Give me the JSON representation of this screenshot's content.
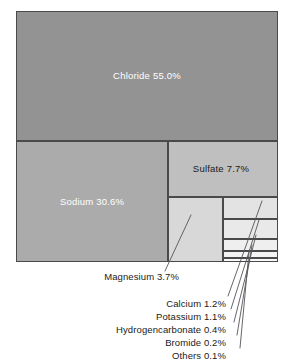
{
  "figure": {
    "background_color": "#ffffff",
    "border_color": "#4a4a4a"
  },
  "chart_data": {
    "type": "treemap",
    "title": "",
    "subtitle": "",
    "xlabel": "",
    "ylabel": "",
    "unit": "%",
    "legend": "none",
    "grid": false,
    "value_total": 100.0,
    "categories": [
      "Chloride",
      "Sodium",
      "Sulfate",
      "Magnesium",
      "Calcium",
      "Potassium",
      "Hydrogencarbonate",
      "Bromide",
      "Others"
    ],
    "values": [
      55.0,
      30.6,
      7.7,
      3.7,
      1.2,
      1.1,
      0.4,
      0.2,
      0.1
    ],
    "series": [
      {
        "name": "Share of dissolved salts",
        "values": [
          55.0,
          30.6,
          7.7,
          3.7,
          1.2,
          1.1,
          0.4,
          0.2,
          0.1
        ]
      }
    ],
    "blocks": [
      {
        "name": "chloride",
        "label": "Chloride 55.0%",
        "category": "Chloride",
        "value": 55.0,
        "value_text": "55.0%",
        "color": "#939393",
        "text_color": "#ffffff",
        "label_placement": "inside",
        "rect": {
          "x": 0,
          "y": 0,
          "w": 262,
          "h": 130
        }
      },
      {
        "name": "sodium",
        "label": "Sodium 30.6%",
        "category": "Sodium",
        "value": 30.6,
        "value_text": "30.6%",
        "color": "#ababab",
        "text_color": "#ffffff",
        "label_placement": "inside",
        "rect": {
          "x": 0,
          "y": 130,
          "w": 152,
          "h": 121
        }
      },
      {
        "name": "sulfate",
        "label": "Sulfate  7.7%",
        "category": "Sulfate",
        "value": 7.7,
        "value_text": "7.7%",
        "color": "#bfbfbf",
        "text_color": "#1a1a1a",
        "label_placement": "inside",
        "rect": {
          "x": 152,
          "y": 130,
          "w": 110,
          "h": 56
        }
      },
      {
        "name": "magnesium",
        "label": "Magnesium 3.7%",
        "category": "Magnesium",
        "value": 3.7,
        "value_text": "3.7%",
        "color": "#d8d8d8",
        "text_color": "#1a1a1a",
        "label_placement": "callout",
        "rect": {
          "x": 152,
          "y": 186,
          "w": 55,
          "h": 65
        }
      },
      {
        "name": "calcium",
        "label": "Calcium 1.2%",
        "category": "Calcium",
        "value": 1.2,
        "value_text": "1.2%",
        "color": "#e3e3e3",
        "text_color": "#1a1a1a",
        "label_placement": "callout",
        "rect": {
          "x": 207,
          "y": 186,
          "w": 55,
          "h": 22
        }
      },
      {
        "name": "potassium",
        "label": "Potassium 1.1%",
        "category": "Potassium",
        "value": 1.1,
        "value_text": "1.1%",
        "color": "#e9e9e9",
        "text_color": "#1a1a1a",
        "label_placement": "callout",
        "rect": {
          "x": 207,
          "y": 208,
          "w": 55,
          "h": 20
        }
      },
      {
        "name": "hydrogencarbonate",
        "label": "Hydrogencarbonate 0.4%",
        "category": "Hydrogencarbonate",
        "value": 0.4,
        "value_text": "0.4%",
        "color": "#efefef",
        "text_color": "#1a1a1a",
        "label_placement": "callout",
        "rect": {
          "x": 207,
          "y": 228,
          "w": 55,
          "h": 12
        }
      },
      {
        "name": "bromide",
        "label": "Bromide 0.2%",
        "category": "Bromide",
        "value": 0.2,
        "value_text": "0.2%",
        "color": "#f4f4f4",
        "text_color": "#1a1a1a",
        "label_placement": "callout",
        "rect": {
          "x": 207,
          "y": 240,
          "w": 55,
          "h": 7
        }
      },
      {
        "name": "others",
        "label": "Others 0.1%",
        "category": "Others",
        "value": 0.1,
        "value_text": "0.1%",
        "color": "#f8f8f8",
        "text_color": "#1a1a1a",
        "label_placement": "callout",
        "rect": {
          "x": 207,
          "y": 247,
          "w": 55,
          "h": 4
        }
      }
    ]
  },
  "callouts": {
    "magnesium": "Magnesium 3.7%",
    "calcium": "Calcium 1.2%",
    "potassium": "Potassium 1.1%",
    "hydrogencarbonate": "Hydrogencarbonate 0.4%",
    "bromide": "Bromide 0.2%",
    "others": "Others 0.1%"
  },
  "inline_labels": {
    "chloride": "Chloride 55.0%",
    "sodium": "Sodium 30.6%",
    "sulfate": "Sulfate  7.7%"
  }
}
